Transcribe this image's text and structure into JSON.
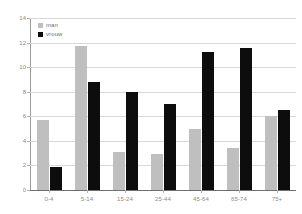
{
  "chart_data": {
    "type": "bar",
    "title": "",
    "subtitle": "",
    "xlabel": "",
    "ylabel": "",
    "ylim": [
      0,
      14
    ],
    "ytick_values": [
      14,
      12,
      10,
      8,
      6,
      4,
      2,
      0
    ],
    "ytick_labels": [
      "14",
      "12",
      "10",
      "8",
      "6",
      "4",
      "2",
      "0"
    ],
    "grid": true,
    "legend_position": "top-left",
    "categories": [
      "0-4",
      "5-14",
      "15-24",
      "25-44",
      "45-64",
      "65-74",
      "75+"
    ],
    "series": [
      {
        "name": "man",
        "color": "#bfbfbf",
        "values": [
          5.7,
          11.7,
          3.1,
          2.9,
          5.0,
          3.4,
          6.0
        ]
      },
      {
        "name": "vrouw",
        "color": "#0d0d0d",
        "values": [
          1.9,
          8.8,
          8.0,
          7.0,
          11.2,
          11.6,
          6.5
        ]
      }
    ]
  }
}
